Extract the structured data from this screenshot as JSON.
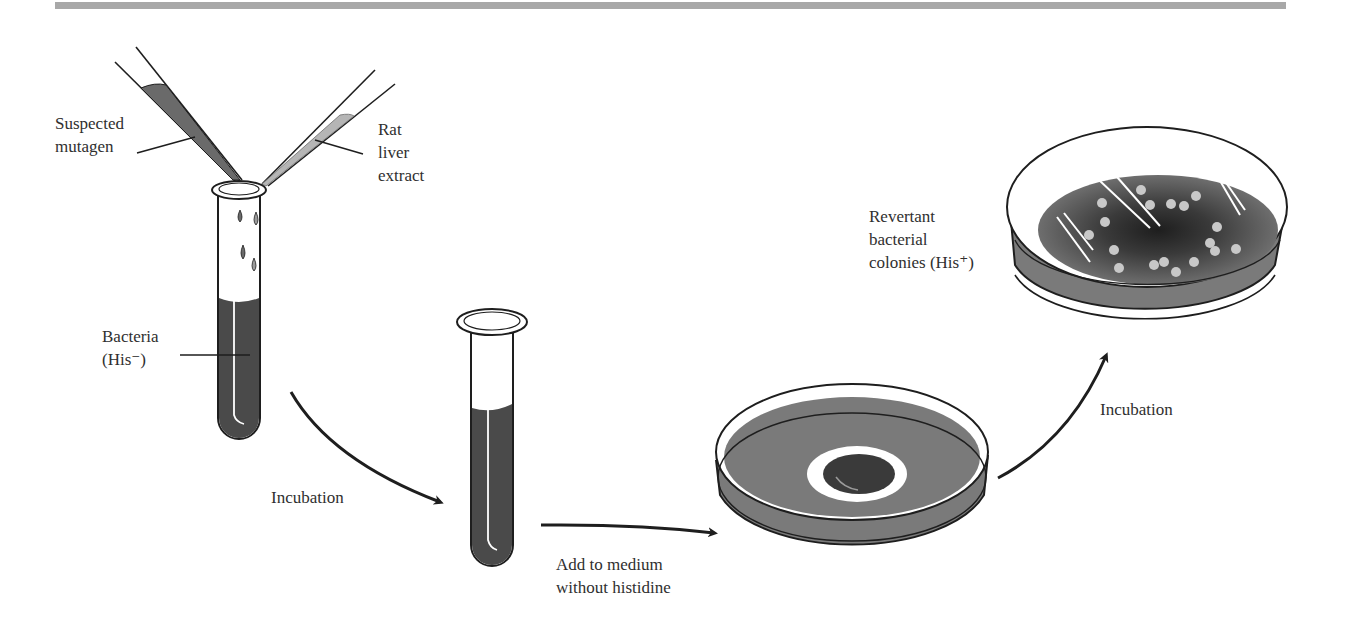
{
  "figure": {
    "labels": {
      "suspected_mutagen": "Suspected\nmutagen",
      "rat_liver_extract": "Rat\nliver\nextract",
      "bacteria": "Bacteria\n(His⁻)",
      "incubation_1": "Incubation",
      "add_to_medium": "Add to medium\nwithout histidine",
      "incubation_2": "Incubation",
      "revertant_colonies": "Revertant\nbacterial\ncolonies (His⁺)"
    },
    "steps": [
      {
        "id": "tube-mix",
        "description": "Test tube with bacteria (His-), suspected mutagen and rat liver extract added by pipettes"
      },
      {
        "id": "tube-incubated",
        "description": "Incubated test tube"
      },
      {
        "id": "plate-initial",
        "description": "Petri dish with medium without histidine, central filter disc"
      },
      {
        "id": "plate-result",
        "description": "Petri dish with revertant bacterial colonies (His+)"
      }
    ],
    "arrows": [
      {
        "from": "tube-mix",
        "to": "tube-incubated",
        "label": "Incubation"
      },
      {
        "from": "tube-incubated",
        "to": "plate-initial",
        "label": "Add to medium without histidine"
      },
      {
        "from": "plate-initial",
        "to": "plate-result",
        "label": "Incubation"
      }
    ],
    "colors": {
      "bar": "#a8a8a8",
      "liquid_dark": "#4a4a4a",
      "medium": "#7a7a7a",
      "pale_liquid": "#b5b5b5",
      "ink": "#1e1e1e"
    }
  }
}
